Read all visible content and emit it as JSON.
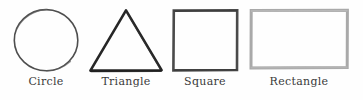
{
  "diagram": {
    "background_color": "#fefefe",
    "label_color": "#3a3a3a",
    "shapes": [
      {
        "name": "circle",
        "label": "Circle",
        "stroke_color": "#4e4e4e",
        "stroke_width": 1.6,
        "fill": "none",
        "style": "hand-drawn",
        "bounds": {
          "x": 14,
          "y": 9,
          "width": 64,
          "height": 62
        }
      },
      {
        "name": "triangle",
        "label": "Triangle",
        "stroke_color": "#262626",
        "stroke_width": 2.6,
        "fill": "none",
        "style": "hand-drawn",
        "bounds": {
          "x": 90,
          "y": 10,
          "width": 72,
          "height": 62
        }
      },
      {
        "name": "square",
        "label": "Square",
        "stroke_color": "#4a4a4a",
        "stroke_width": 2.6,
        "fill": "none",
        "style": "hand-drawn",
        "bounds": {
          "x": 173,
          "y": 10,
          "width": 64,
          "height": 61
        }
      },
      {
        "name": "rectangle",
        "label": "Rectangle",
        "stroke_color": "#a9a9a9",
        "stroke_width": 3.0,
        "fill": "none",
        "style": "hand-drawn",
        "bounds": {
          "x": 250,
          "y": 10,
          "width": 97,
          "height": 58
        }
      }
    ]
  }
}
